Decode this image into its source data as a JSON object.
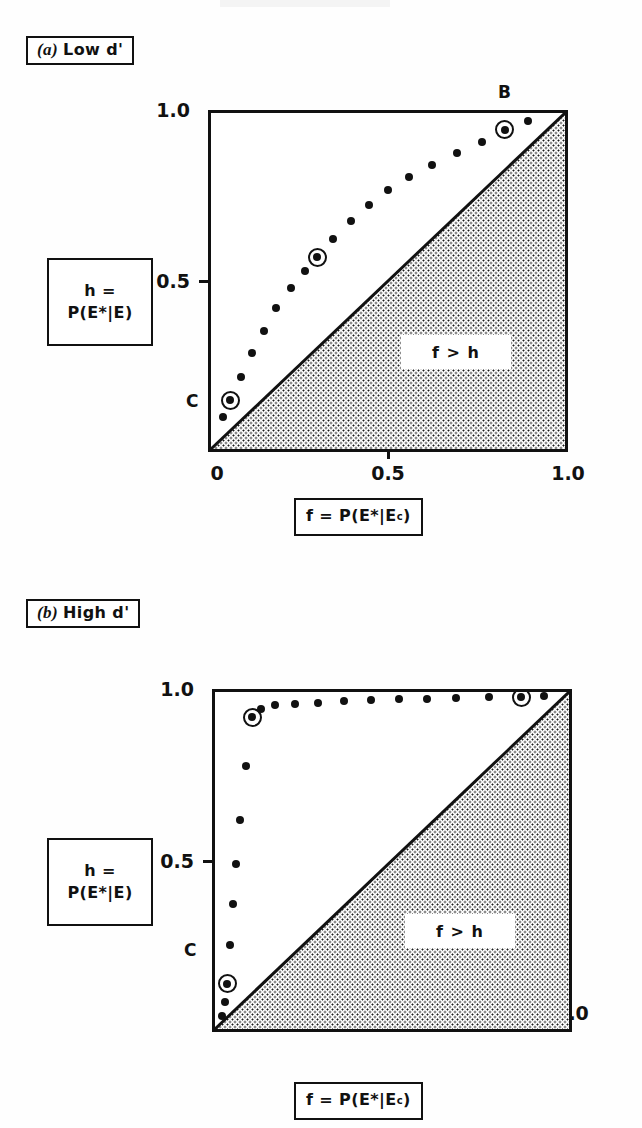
{
  "figure": {
    "ink_color": "#111111",
    "paper_color": "#ffffff"
  },
  "panels": [
    {
      "id": "a",
      "tag_paren": "(a)",
      "tag_text": "Low d'",
      "y_axis_label_line1": "h =",
      "y_axis_label_line2": "P(E*|E)",
      "x_axis_label_prefix": "f = P(E*|E",
      "x_axis_label_sup": "c",
      "x_axis_label_suffix": " )",
      "region_label": "f > h",
      "x_ticks": [
        {
          "value": 0,
          "label": "0"
        },
        {
          "value": 0.5,
          "label": "0.5"
        },
        {
          "value": 1.0,
          "label": "1.0"
        }
      ],
      "y_ticks": [
        {
          "value": 0.5,
          "label": "0.5"
        },
        {
          "value": 1.0,
          "label": "1.0"
        }
      ],
      "marked_points": [
        {
          "name": "A",
          "f": 0.3,
          "h": 0.57
        },
        {
          "name": "B",
          "f": 0.83,
          "h": 0.95
        },
        {
          "name": "C",
          "f": 0.055,
          "h": 0.145
        }
      ]
    },
    {
      "id": "b",
      "tag_paren": "(b)",
      "tag_text": "High d'",
      "y_axis_label_line1": "h =",
      "y_axis_label_line2": "P(E*|E)",
      "x_axis_label_prefix": "f = P(E*|E",
      "x_axis_label_sup": "c",
      "x_axis_label_suffix": " )",
      "region_label": "f > h",
      "x_ticks": [
        {
          "value": 0,
          "label": "0"
        },
        {
          "value": 0.5,
          "label": "0.5"
        },
        {
          "value": 1.0,
          "label": "1.0"
        }
      ],
      "y_ticks": [
        {
          "value": 0.5,
          "label": "0.5"
        },
        {
          "value": 1.0,
          "label": "1.0"
        }
      ],
      "marked_points": [
        {
          "name": "A",
          "f": 0.105,
          "h": 0.925
        },
        {
          "name": "B",
          "f": 0.865,
          "h": 0.985
        },
        {
          "name": "C",
          "f": 0.035,
          "h": 0.135
        }
      ]
    }
  ],
  "chart_data": [
    {
      "type": "scatter",
      "title": "(a) Low d'",
      "xlabel": "f = P(E*|Ec)",
      "ylabel": "h = P(E*|E)",
      "xlim": [
        0,
        1
      ],
      "ylim": [
        0,
        1
      ],
      "grid": false,
      "legend": null,
      "annotations": [
        "f > h",
        "A",
        "B",
        "C"
      ],
      "reference_line": {
        "name": "chance diagonal",
        "from": [
          0,
          0
        ],
        "to": [
          1,
          1
        ]
      },
      "shaded_region": {
        "name": "f > h",
        "below_diagonal": true
      },
      "series": [
        {
          "name": "ROC low d'",
          "marker": "filled-circle",
          "x": [
            0.035,
            0.055,
            0.085,
            0.115,
            0.15,
            0.185,
            0.225,
            0.265,
            0.3,
            0.345,
            0.395,
            0.445,
            0.5,
            0.56,
            0.625,
            0.695,
            0.765,
            0.83,
            0.895
          ],
          "y": [
            0.095,
            0.145,
            0.215,
            0.285,
            0.35,
            0.42,
            0.48,
            0.53,
            0.57,
            0.625,
            0.68,
            0.725,
            0.77,
            0.81,
            0.845,
            0.88,
            0.915,
            0.95,
            0.975
          ]
        }
      ],
      "circled_points": [
        {
          "label": "A",
          "x": 0.3,
          "y": 0.57
        },
        {
          "label": "B",
          "x": 0.83,
          "y": 0.95
        },
        {
          "label": "C",
          "x": 0.055,
          "y": 0.145
        }
      ]
    },
    {
      "type": "scatter",
      "title": "(b) High d'",
      "xlabel": "f = P(E*|Ec)",
      "ylabel": "h = P(E*|E)",
      "xlim": [
        0,
        1
      ],
      "ylim": [
        0,
        1
      ],
      "grid": false,
      "legend": null,
      "annotations": [
        "f > h",
        "A",
        "B",
        "C"
      ],
      "reference_line": {
        "name": "chance diagonal",
        "from": [
          0,
          0
        ],
        "to": [
          1,
          1
        ]
      },
      "shaded_region": {
        "name": "f > h",
        "below_diagonal": true
      },
      "series": [
        {
          "name": "ROC high d'",
          "marker": "filled-circle",
          "x": [
            0.02,
            0.028,
            0.035,
            0.042,
            0.05,
            0.06,
            0.072,
            0.088,
            0.105,
            0.13,
            0.17,
            0.225,
            0.29,
            0.365,
            0.44,
            0.52,
            0.6,
            0.68,
            0.775,
            0.865,
            0.93
          ],
          "y": [
            0.04,
            0.08,
            0.135,
            0.25,
            0.37,
            0.49,
            0.62,
            0.78,
            0.925,
            0.95,
            0.96,
            0.965,
            0.968,
            0.972,
            0.975,
            0.978,
            0.98,
            0.982,
            0.984,
            0.985,
            0.988
          ]
        }
      ],
      "circled_points": [
        {
          "label": "A",
          "x": 0.105,
          "y": 0.925
        },
        {
          "label": "B",
          "x": 0.865,
          "y": 0.985
        },
        {
          "label": "C",
          "x": 0.035,
          "y": 0.135
        }
      ]
    }
  ]
}
